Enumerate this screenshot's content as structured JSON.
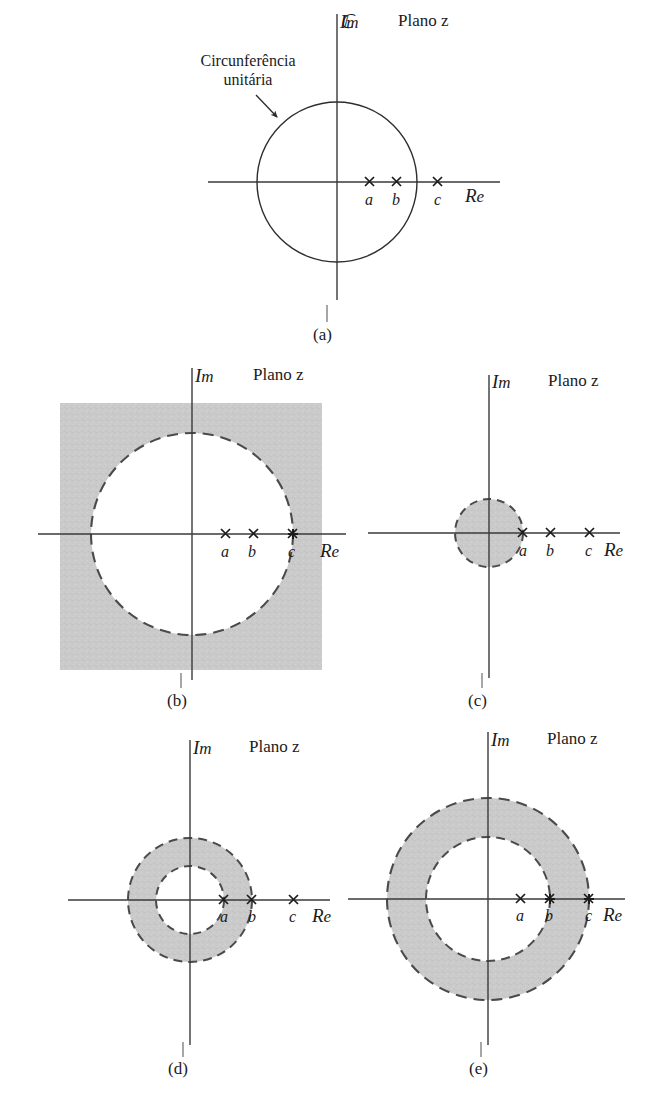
{
  "figure": {
    "caption_labels": [
      "(a)",
      "(b)",
      "(c)",
      "(d)",
      "(e)"
    ],
    "axis_im": "Im",
    "axis_re": "Re",
    "plane_label": "Plano z",
    "callout": {
      "line1": "Circunferência",
      "line2": "unitária"
    },
    "pole_labels": [
      "a",
      "b",
      "c"
    ],
    "colors": {
      "ink": "#1b1b1b",
      "shade": "#c9c9c9",
      "shade_edge": "#555555",
      "background": "#ffffff"
    }
  },
  "chart_data": {
    "type": "scatter",
    "xlabel": "Re",
    "ylabel": "Im",
    "grid": false,
    "legend": null,
    "annotations": [
      "Circunferência unitária"
    ],
    "panels": [
      {
        "id": "(a)",
        "origin": [
          337,
          182
        ],
        "plane_label": "Plano z",
        "poles": [
          {
            "label": "a",
            "x": 370,
            "radius_px": 33,
            "marker": "x"
          },
          {
            "label": "b",
            "x": 397,
            "radius_px": 60,
            "marker": "x"
          },
          {
            "label": "c",
            "x": 438,
            "radius_px": 101,
            "marker": "x"
          }
        ],
        "unit_circle": {
          "radius_px": 80,
          "style": "solid",
          "labelled": true
        },
        "shaded_region": null
      },
      {
        "id": "(b)",
        "origin": [
          192,
          534
        ],
        "plane_label": "Plano z",
        "poles": [
          {
            "label": "a",
            "x": 226,
            "radius_px": 34,
            "marker": "x"
          },
          {
            "label": "b",
            "x": 254,
            "radius_px": 62,
            "marker": "x"
          },
          {
            "label": "c",
            "x": 293,
            "radius_px": 101,
            "marker": "x",
            "on_boundary": true
          }
        ],
        "shaded_region": {
          "kind": "exterior-of-circle",
          "inner_radius_px": 101,
          "outer": "square",
          "square": {
            "x": 60,
            "y": 403,
            "w": 262,
            "h": 267
          },
          "boundary_style": "dashed"
        }
      },
      {
        "id": "(c)",
        "origin": [
          489,
          533
        ],
        "plane_label": "Plano z",
        "poles": [
          {
            "label": "a",
            "x": 523,
            "radius_px": 34,
            "marker": "x",
            "on_boundary": true
          },
          {
            "label": "b",
            "x": 551,
            "radius_px": 62,
            "marker": "x"
          },
          {
            "label": "c",
            "x": 590,
            "radius_px": 101,
            "marker": "x"
          }
        ],
        "shaded_region": {
          "kind": "disk",
          "outer_radius_px": 34,
          "boundary_style": "dashed"
        }
      },
      {
        "id": "(d)",
        "origin": [
          190,
          900
        ],
        "plane_label": "Plano z",
        "poles": [
          {
            "label": "a",
            "x": 224,
            "radius_px": 34,
            "marker": "x",
            "on_boundary": true
          },
          {
            "label": "b",
            "x": 252,
            "radius_px": 62,
            "marker": "x",
            "on_boundary": true
          },
          {
            "label": "c",
            "x": 294,
            "radius_px": 104,
            "marker": "x"
          }
        ],
        "shaded_region": {
          "kind": "annulus",
          "inner_radius_px": 34,
          "outer_radius_px": 62,
          "boundary_style": "dashed"
        }
      },
      {
        "id": "(e)",
        "origin": [
          488,
          899
        ],
        "plane_label": "Plano z",
        "poles": [
          {
            "label": "a",
            "x": 521,
            "radius_px": 33,
            "marker": "x"
          },
          {
            "label": "b",
            "x": 550,
            "radius_px": 62,
            "marker": "x",
            "on_boundary": true
          },
          {
            "label": "c",
            "x": 589,
            "radius_px": 101,
            "marker": "x",
            "on_boundary": true
          }
        ],
        "shaded_region": {
          "kind": "annulus",
          "inner_radius_px": 62,
          "outer_radius_px": 101,
          "boundary_style": "dashed"
        }
      }
    ]
  }
}
